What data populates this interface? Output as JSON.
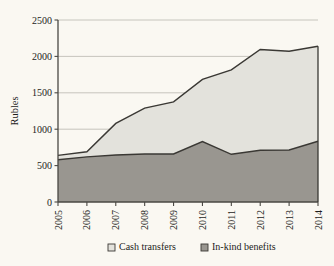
{
  "chart_data": {
    "type": "area",
    "title": "",
    "xlabel": "",
    "ylabel": "Rubles",
    "categories": [
      "2005",
      "2006",
      "2007",
      "2008",
      "2009",
      "2010",
      "2011",
      "2012",
      "2013",
      "2014"
    ],
    "series": [
      {
        "name": "In-kind benefits",
        "color": "#999690",
        "values": [
          580,
          620,
          645,
          660,
          660,
          830,
          655,
          710,
          715,
          835
        ]
      },
      {
        "name": "Cash transfers",
        "color": "#e3e2dc",
        "values": [
          60,
          70,
          435,
          630,
          715,
          855,
          1160,
          1385,
          1355,
          1305
        ]
      }
    ],
    "totals": [
      640,
      690,
      1080,
      1290,
      1375,
      1685,
      1815,
      2095,
      2070,
      2140
    ],
    "stacked": true,
    "ylim": [
      0,
      2500
    ],
    "yticks": [
      0,
      500,
      1000,
      1500,
      2000,
      2500
    ],
    "ytick_labels": [
      "0",
      "500",
      "1000",
      "1500",
      "2000",
      "2500"
    ],
    "grid": true,
    "legend_position": "bottom",
    "legend": [
      {
        "label": "Cash transfers",
        "swatch": "#e3e2dc",
        "key": "cash-transfers"
      },
      {
        "label": "In-kind benefits",
        "swatch": "#999690",
        "key": "in-kind-benefits"
      }
    ],
    "colors": {
      "background": "#faf8f2",
      "axis": "#4a4843",
      "grid": "#b9b7b0",
      "line": "#3a3834",
      "text": "#1d1d1b"
    }
  }
}
